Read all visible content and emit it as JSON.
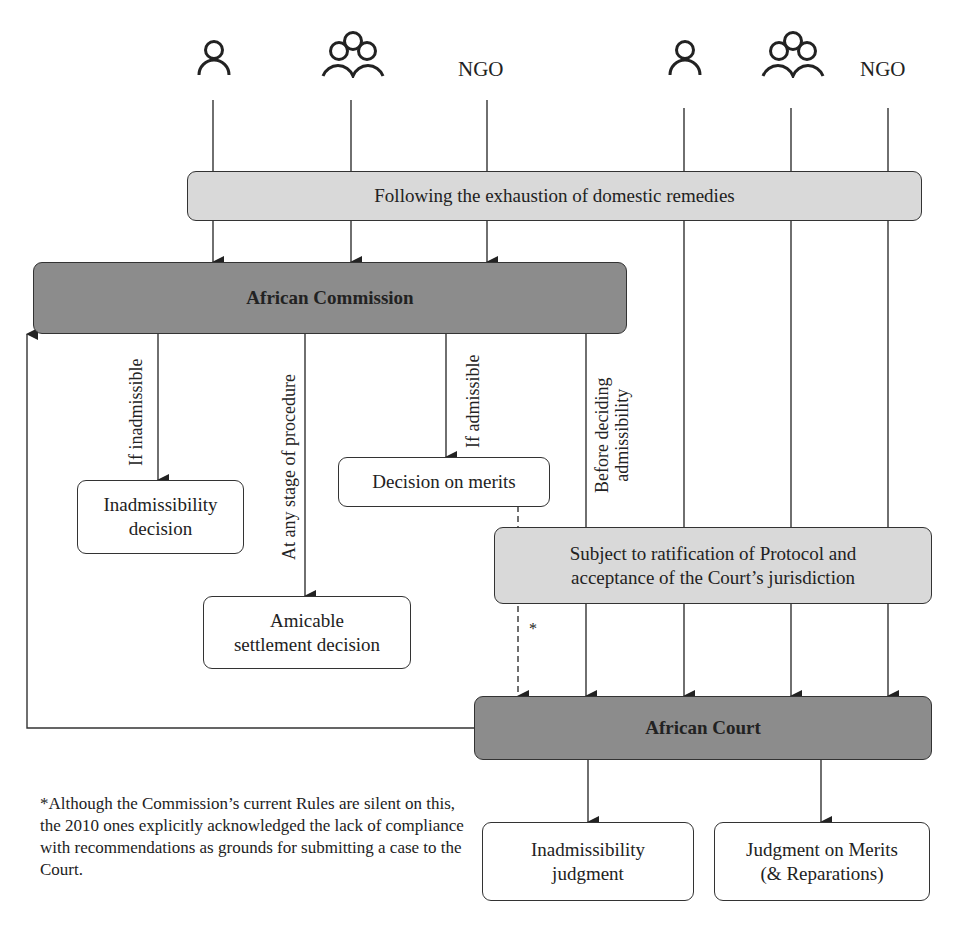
{
  "actors": {
    "left": [
      {
        "icon": "person-icon",
        "label": ""
      },
      {
        "icon": "group-icon",
        "label": ""
      },
      {
        "icon": "",
        "label": "NGO"
      }
    ],
    "right": [
      {
        "icon": "person-icon",
        "label": ""
      },
      {
        "icon": "group-icon",
        "label": ""
      },
      {
        "icon": "",
        "label": "NGO"
      }
    ]
  },
  "boxes": {
    "exhaustion": "Following the exhaustion of domestic remedies",
    "commission": "African Commission",
    "inadmissibility_decision": [
      "Inadmissibility",
      "decision"
    ],
    "decision_on_merits": "Decision on merits",
    "amicable_settlement": [
      "Amicable",
      "settlement decision"
    ],
    "subject_to_ratification": [
      "Subject to ratification of Protocol and",
      "acceptance of the Court’s jurisdiction"
    ],
    "court": "African Court",
    "inadmissibility_judgment": [
      "Inadmissibility",
      "judgment"
    ],
    "judgment_on_merits": [
      "Judgment on Merits",
      "(& Reparations)"
    ]
  },
  "edge_labels": {
    "if_inadmissible": "If inadmissible",
    "any_stage": "At any stage of procedure",
    "if_admissible": "If admissible",
    "before_deciding": [
      "Before deciding",
      "admissibility"
    ],
    "asterisk": "*"
  },
  "footnote": "*Although the Commission’s current Rules are silent on this, the 2010 ones explicitly acknowledged the lack of compliance with recommendations as grounds for submitting a case to the Court.",
  "colors": {
    "light_box": "#d9d9d9",
    "dark_box": "#8c8c8c",
    "stroke": "#333333"
  }
}
